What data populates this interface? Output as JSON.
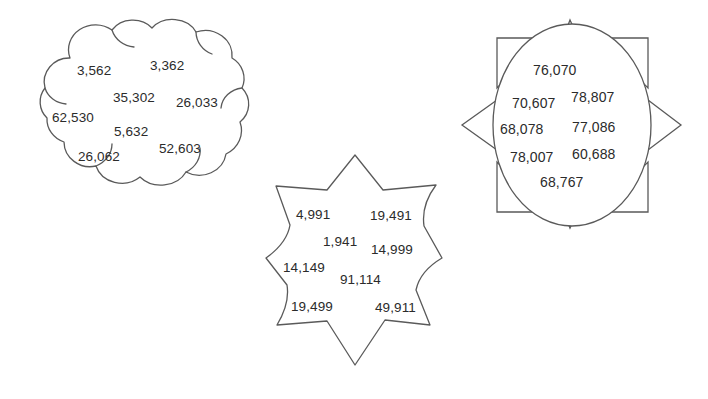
{
  "page": {
    "background_color": "#ffffff",
    "outline_color": "#5a5a5a",
    "text_color": "#2b2b2b",
    "width": 708,
    "height": 399
  },
  "shapes": [
    {
      "id": "cloud",
      "name": "cloud-shape",
      "label": "cloud",
      "numbers": [
        {
          "value": "3,562",
          "x": 77,
          "y": 64
        },
        {
          "value": "3,362",
          "x": 150,
          "y": 59
        },
        {
          "value": "35,302",
          "x": 113,
          "y": 91
        },
        {
          "value": "26,033",
          "x": 176,
          "y": 96
        },
        {
          "value": "62,530",
          "x": 52,
          "y": 111
        },
        {
          "value": "5,632",
          "x": 114,
          "y": 125
        },
        {
          "value": "52,603",
          "x": 159,
          "y": 142
        },
        {
          "value": "26,062",
          "x": 78,
          "y": 150
        }
      ]
    },
    {
      "id": "star",
      "name": "six-pointed-star-shape",
      "label": "six-pointed star",
      "numbers": [
        {
          "value": "4,991",
          "x": 296,
          "y": 208
        },
        {
          "value": "19,491",
          "x": 370,
          "y": 209
        },
        {
          "value": "1,941",
          "x": 323,
          "y": 235
        },
        {
          "value": "14,999",
          "x": 371,
          "y": 243
        },
        {
          "value": "14,149",
          "x": 283,
          "y": 261
        },
        {
          "value": "91,114",
          "x": 340,
          "y": 273
        },
        {
          "value": "19,499",
          "x": 291,
          "y": 300
        },
        {
          "value": "49,911",
          "x": 375,
          "y": 301
        }
      ]
    },
    {
      "id": "sun",
      "name": "sun-shape",
      "label": "sun with rays",
      "numbers": [
        {
          "value": "76,070",
          "x": 533,
          "y": 63
        },
        {
          "value": "70,607",
          "x": 512,
          "y": 96
        },
        {
          "value": "78,807",
          "x": 571,
          "y": 90
        },
        {
          "value": "68,078",
          "x": 500,
          "y": 122
        },
        {
          "value": "77,086",
          "x": 572,
          "y": 120
        },
        {
          "value": "78,007",
          "x": 510,
          "y": 150
        },
        {
          "value": "60,688",
          "x": 572,
          "y": 147
        },
        {
          "value": "68,767",
          "x": 540,
          "y": 175
        }
      ]
    }
  ]
}
